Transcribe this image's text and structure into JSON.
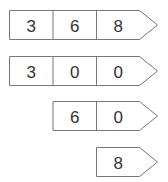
{
  "diagram": {
    "rows": [
      {
        "cells": [
          "3",
          "6",
          "8"
        ],
        "left": 9,
        "top": 10
      },
      {
        "cells": [
          "3",
          "0",
          "0"
        ],
        "left": 9,
        "top": 56
      },
      {
        "cells": [
          "6",
          "0"
        ],
        "left": 52,
        "top": 101
      },
      {
        "cells": [
          "8"
        ],
        "left": 96,
        "top": 147
      }
    ],
    "cell_width": 43.5,
    "row_height": 29,
    "arrow_extra": 18,
    "colors": {
      "stroke": "#777777",
      "text": "#333333",
      "fill": "#ffffff"
    }
  }
}
